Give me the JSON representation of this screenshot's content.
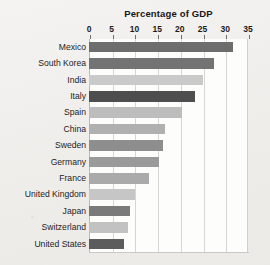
{
  "chart_data": {
    "type": "bar",
    "orientation": "horizontal",
    "title": "Percentage of GDP",
    "xlabel": "",
    "ylabel": "",
    "xlim": [
      0,
      35
    ],
    "xticks": [
      0,
      5,
      10,
      15,
      20,
      25,
      30,
      35
    ],
    "grid": true,
    "legend": "none",
    "categories": [
      "Mexico",
      "South Korea",
      "India",
      "Italy",
      "Spain",
      "China",
      "Sweden",
      "Germany",
      "France",
      "United Kingdom",
      "Japan",
      "Switzerland",
      "United States"
    ],
    "values": [
      31.8,
      27.5,
      25.0,
      23.3,
      20.5,
      16.8,
      16.3,
      15.3,
      13.2,
      10.1,
      9.0,
      8.6,
      7.8
    ],
    "bar_colors": [
      "#6d6d6d",
      "#737373",
      "#cacaca",
      "#4e4e4e",
      "#bdbdbd",
      "#b0b0b0",
      "#8e8e8e",
      "#9a9a9a",
      "#aaaaaa",
      "#c6c6c6",
      "#7a7a7a",
      "#c2c2c2",
      "#5c5c5c"
    ]
  },
  "colors": {
    "page_background": "#f2f0ee",
    "plot_background": "#fdfdfc",
    "gridline": "#d6d6d4",
    "axis": "#b9b9b7",
    "text": "#232323"
  }
}
